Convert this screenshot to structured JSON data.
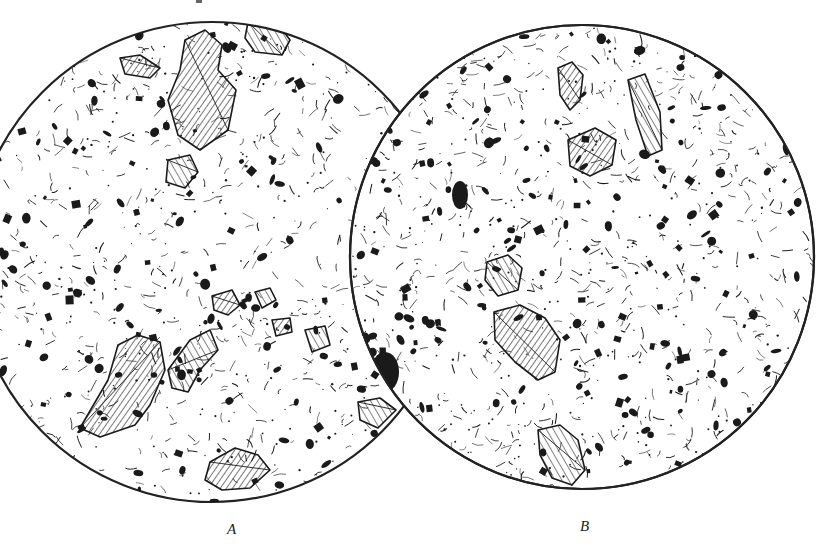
{
  "figure": {
    "panels": [
      {
        "id": "A",
        "label": "A",
        "shape": "circle",
        "center": [
          212,
          262
        ],
        "radius": 240,
        "crystal_clusters": [
          {
            "name": "top-cluster",
            "points": "185,40 205,30 222,45 218,70 236,90 228,130 200,150 178,135 168,100 180,70"
          },
          {
            "name": "top-right-plate",
            "points": "248,22 275,20 290,40 282,55 255,52 245,38"
          },
          {
            "name": "upper-left-small",
            "points": "120,58 140,55 160,68 150,78 125,74"
          },
          {
            "name": "mid-left-fragment",
            "points": "168,160 190,155 198,172 185,188 166,182"
          },
          {
            "name": "center-small-1",
            "points": "212,296 232,290 240,305 228,315 214,310"
          },
          {
            "name": "center-small-2",
            "points": "255,292 270,288 276,300 262,308"
          },
          {
            "name": "right-small",
            "points": "272,320 290,318 292,332 276,336"
          },
          {
            "name": "right-small-2",
            "points": "305,330 325,326 330,345 312,352"
          },
          {
            "name": "bottom-left-large",
            "points": "80,428 108,380 118,345 138,335 160,342 165,370 150,405 135,425 100,437"
          },
          {
            "name": "bottom-middle",
            "points": "168,370 190,340 210,330 218,350 200,370 188,392 172,388"
          },
          {
            "name": "bottom-cluster",
            "points": "210,462 235,448 258,455 270,470 250,488 222,490 205,480"
          },
          {
            "name": "right-edge-fragment",
            "points": "358,402 380,398 396,410 378,428 360,420"
          }
        ]
      },
      {
        "id": "B",
        "label": "B",
        "shape": "circle",
        "center": [
          582,
          257
        ],
        "radius": 232,
        "crystal_clusters": [
          {
            "name": "top-left-leaf",
            "points": "558,68 572,62 583,75 580,100 570,110 560,95"
          },
          {
            "name": "top-right-rod",
            "points": "628,80 645,74 660,112 662,150 648,156 636,120"
          },
          {
            "name": "upper-center-plate",
            "points": "568,140 595,128 616,140 612,165 590,176 570,166"
          },
          {
            "name": "center-left-plate",
            "points": "487,262 508,255 522,268 518,290 498,296 485,280"
          },
          {
            "name": "center-large",
            "points": "494,312 520,305 545,318 560,340 555,372 538,380 515,362 495,340"
          },
          {
            "name": "bottom-rod",
            "points": "538,430 560,425 578,440 585,470 572,485 552,478 540,455"
          }
        ],
        "large_dark_blobs": [
          {
            "name": "left-edge-blob",
            "cx": 385,
            "cy": 372,
            "rx": 14,
            "ry": 20
          },
          {
            "name": "center-blob",
            "cx": 460,
            "cy": 195,
            "rx": 8,
            "ry": 14
          }
        ]
      }
    ],
    "colors": {
      "ink": "#1a1a1a",
      "background": "#ffffff",
      "outline": "#222222"
    }
  }
}
